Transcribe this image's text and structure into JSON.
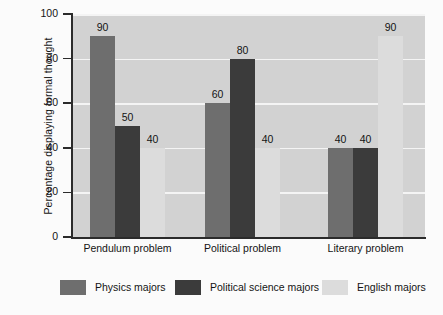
{
  "chart_data": {
    "type": "bar",
    "title": "",
    "xlabel": "",
    "ylabel": "Percentage displaying formal thought",
    "ylim": [
      0,
      100
    ],
    "ytick_values": [
      0,
      20,
      40,
      60,
      80,
      100
    ],
    "ytick_labels": [
      "0",
      "20",
      "40",
      "60",
      "80",
      "100"
    ],
    "categories": [
      "Pendulum problem",
      "Political problem",
      "Literary problem"
    ],
    "grid": "horizontal",
    "legend_position": "bottom",
    "series": [
      {
        "name": "Physics majors",
        "color": "#6e6e6e",
        "values": [
          90,
          60,
          40
        ],
        "value_labels": [
          "90",
          "60",
          "40"
        ]
      },
      {
        "name": "Political science majors",
        "color": "#3b3b3b",
        "values": [
          50,
          80,
          40
        ],
        "value_labels": [
          "50",
          "80",
          "40"
        ]
      },
      {
        "name": "English majors",
        "color": "#dcdcdc",
        "values": [
          40,
          40,
          90
        ],
        "value_labels": [
          "40",
          "40",
          "90"
        ]
      }
    ]
  },
  "colors": {
    "plot_background": "#d2d2d2",
    "gridline": "#f4f4f4",
    "axis": "#2b2b2b",
    "text": "#141414",
    "page_background": "#fbfbfb"
  }
}
